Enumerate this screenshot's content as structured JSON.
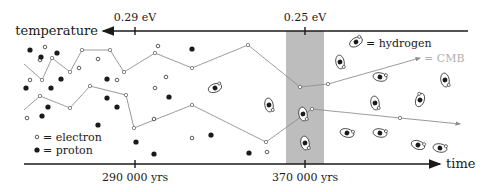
{
  "diagram": {
    "type": "recombination-timeline",
    "colors": {
      "axis": "#1a1a1a",
      "band": "#bdbdbd",
      "photon": "#8c8c8c",
      "cmb_label": "#b0b0b0",
      "proton": "#1a1a1a",
      "electron_stroke": "#333333"
    },
    "top_axis": {
      "label": "temperature",
      "direction": "left",
      "ticks": [
        {
          "label": "0.29 eV",
          "x": 135
        },
        {
          "label": "0.25 eV",
          "x": 305
        }
      ]
    },
    "bottom_axis": {
      "label": "time",
      "direction": "right",
      "ticks": [
        {
          "label": "290 000 yrs",
          "x": 135
        },
        {
          "label": "370 000 yrs",
          "x": 305
        }
      ]
    },
    "band": {
      "x_start": 286,
      "x_end": 324,
      "meaning": "recombination / decoupling"
    },
    "legend": {
      "electron": "= electron",
      "proton": "= proton",
      "hydrogen": "= hydrogen",
      "cmb": "= CMB"
    },
    "photon_paths": [
      {
        "name": "upper",
        "points": [
          [
            24,
            64
          ],
          [
            42,
            80
          ],
          [
            52,
            58
          ],
          [
            70,
            72
          ],
          [
            82,
            50
          ],
          [
            110,
            50
          ],
          [
            124,
            72
          ],
          [
            155,
            53
          ],
          [
            192,
            68
          ],
          [
            248,
            45
          ],
          [
            300,
            87
          ],
          [
            328,
            84
          ],
          [
            420,
            58
          ]
        ]
      },
      {
        "name": "lower",
        "points": [
          [
            24,
            110
          ],
          [
            40,
            96
          ],
          [
            70,
            108
          ],
          [
            90,
            86
          ],
          [
            126,
            95
          ],
          [
            134,
            128
          ],
          [
            192,
            105
          ],
          [
            266,
            142
          ],
          [
            312,
            109
          ],
          [
            400,
            118
          ],
          [
            460,
            124
          ]
        ]
      }
    ],
    "electrons": [
      [
        45,
        47
      ],
      [
        40,
        60
      ],
      [
        98,
        59
      ],
      [
        79,
        68
      ],
      [
        30,
        80
      ],
      [
        117,
        80
      ],
      [
        166,
        77
      ],
      [
        27,
        118
      ],
      [
        155,
        88
      ],
      [
        154,
        119
      ],
      [
        192,
        138
      ],
      [
        267,
        152
      ],
      [
        158,
        46
      ]
    ],
    "protons": [
      [
        30,
        50
      ],
      [
        41,
        57
      ],
      [
        57,
        53
      ],
      [
        61,
        79
      ],
      [
        26,
        88
      ],
      [
        51,
        88
      ],
      [
        107,
        79
      ],
      [
        48,
        107
      ],
      [
        42,
        116
      ],
      [
        107,
        98
      ],
      [
        117,
        107
      ],
      [
        98,
        125
      ],
      [
        136,
        142
      ],
      [
        154,
        154
      ],
      [
        211,
        135
      ],
      [
        249,
        153
      ],
      [
        192,
        49
      ],
      [
        169,
        97
      ]
    ],
    "hydrogens": [
      {
        "x": 215,
        "y": 88,
        "rot": -20
      },
      {
        "x": 269,
        "y": 105,
        "rot": 80
      },
      {
        "x": 303,
        "y": 114,
        "rot": 80
      },
      {
        "x": 340,
        "y": 62,
        "rot": 80
      },
      {
        "x": 380,
        "y": 77,
        "rot": 10
      },
      {
        "x": 380,
        "y": 133,
        "rot": 10
      },
      {
        "x": 420,
        "y": 100,
        "rot": -70
      },
      {
        "x": 418,
        "y": 145,
        "rot": 20
      },
      {
        "x": 445,
        "y": 80,
        "rot": 80
      },
      {
        "x": 420,
        "y": 47,
        "rot": -30
      },
      {
        "x": 375,
        "y": 103,
        "rot": 80
      },
      {
        "x": 347,
        "y": 133,
        "rot": 15
      },
      {
        "x": 305,
        "y": 143,
        "rot": 80
      },
      {
        "x": 440,
        "y": 148,
        "rot": 10
      },
      {
        "x": 451,
        "y": 42,
        "rot": 80
      }
    ],
    "legend_hydrogen_icon": {
      "x": 356,
      "y": 42,
      "rot": -30
    }
  }
}
